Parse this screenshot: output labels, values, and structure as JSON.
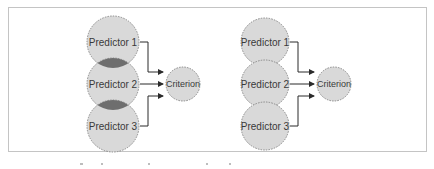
{
  "figure": {
    "colors": {
      "circle_fill": "#d9d9d9",
      "circle_stroke": "#8a8a8a",
      "overlap_fill": "#6e6e6e",
      "arrow": "#2b2b2b",
      "frame_border": "#c4c4c4"
    },
    "panels": [
      {
        "id": "overlapping",
        "predictors": [
          {
            "label": "Predictor 1"
          },
          {
            "label": "Predictor 2"
          },
          {
            "label": "Predictor 3"
          }
        ],
        "criterion": {
          "label": "Criterion"
        },
        "predictors_overlap": true
      },
      {
        "id": "non-overlapping",
        "predictors": [
          {
            "label": "Predictor 1"
          },
          {
            "label": "Predictor 2"
          },
          {
            "label": "Predictor 3"
          }
        ],
        "criterion": {
          "label": "Criterion"
        },
        "predictors_overlap": false
      }
    ]
  }
}
